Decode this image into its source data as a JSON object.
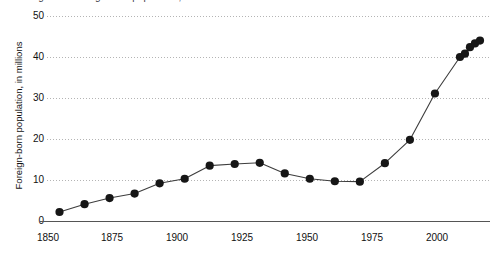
{
  "clipped_header": {
    "text": "Figure 1. Foreign-born population, in millions: 1850 to 2018"
  },
  "axes": {
    "y_title": "Foreign-born population, in millions",
    "y_ticks": [
      "0",
      "10",
      "20",
      "30",
      "40",
      "50"
    ],
    "x_ticks": [
      "1850",
      "1875",
      "1900",
      "1925",
      "1950",
      "1975",
      "2000"
    ]
  },
  "style": {
    "marker_color": "#161616",
    "line_color": "#3d3d3d",
    "grid_color": "#b4b4b4",
    "axis_color": "#555555",
    "text_color": "#111111"
  },
  "chart_data": {
    "type": "line",
    "title": "Foreign-born population, in millions: 1850 to 2018",
    "xlabel": "",
    "ylabel": "Foreign-born population, in millions",
    "xlim": [
      1845,
      2022
    ],
    "ylim": [
      0,
      50
    ],
    "grid": true,
    "legend": "none",
    "marker": "filled-circle",
    "x_ticks": [
      1850,
      1875,
      1900,
      1925,
      1950,
      1975,
      2000
    ],
    "y_ticks": [
      0,
      10,
      20,
      30,
      40,
      50
    ],
    "series": [
      {
        "name": "Foreign-born population",
        "x": [
          1850,
          1860,
          1870,
          1880,
          1890,
          1900,
          1910,
          1920,
          1930,
          1940,
          1950,
          1960,
          1970,
          1980,
          1990,
          2000,
          2010,
          2012,
          2014,
          2016,
          2018
        ],
        "values": [
          2.2,
          4.1,
          5.6,
          6.7,
          9.2,
          10.3,
          13.5,
          13.9,
          14.2,
          11.6,
          10.3,
          9.7,
          9.6,
          14.1,
          19.8,
          31.1,
          40.0,
          40.8,
          42.4,
          43.3,
          44.0
        ]
      }
    ]
  }
}
